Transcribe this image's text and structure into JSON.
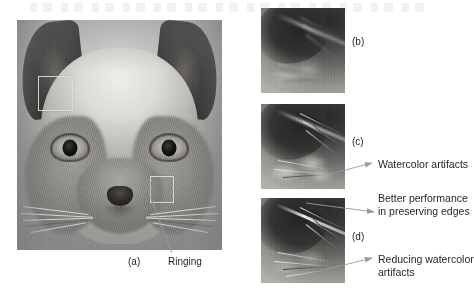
{
  "figure": {
    "panels": [
      {
        "key": "a",
        "label": "(a)",
        "caption_role": "original-image"
      },
      {
        "key": "b",
        "label": "(b)",
        "caption_role": "crop-blurred"
      },
      {
        "key": "c",
        "label": "(c)",
        "caption_role": "crop-watercolor"
      },
      {
        "key": "d",
        "label": "(d)",
        "caption_role": "crop-improved"
      }
    ],
    "annotations": [
      {
        "id": "ringing",
        "text": "Ringing",
        "target_panel": "a"
      },
      {
        "id": "watercolor-artifacts",
        "text": "Watercolor artifacts",
        "target_panel": "c"
      },
      {
        "id": "better-performance",
        "text": "Better performance\nin preserving edges",
        "target_panel": "d"
      },
      {
        "id": "reducing-watercolor",
        "text": "Reducing watercolor\nartifacts",
        "target_panel": "d"
      }
    ],
    "colors": {
      "background": "#ffffff",
      "text": "#231f20",
      "roi_box": "#dedeDA",
      "leader_line": "#9a9a9a"
    }
  }
}
